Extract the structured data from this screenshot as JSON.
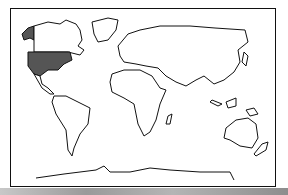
{
  "map": {
    "type": "world-outline",
    "highlighted_region": "United States (incl. Alaska)",
    "highlight_color": "#555555",
    "outline_color": "#111111",
    "background": "#ffffff"
  }
}
